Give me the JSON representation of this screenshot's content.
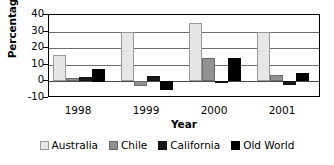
{
  "chart_data": {
    "type": "bar",
    "title": "",
    "xlabel": "Year",
    "ylabel": "Percentage",
    "categories": [
      "1998",
      "1999",
      "2000",
      "2001"
    ],
    "ylim": [
      -10,
      40
    ],
    "yticks": [
      40,
      30,
      20,
      10,
      0,
      -10
    ],
    "ytick_labels": [
      "40",
      "30",
      "20",
      "10",
      "0",
      "-10"
    ],
    "grid": true,
    "legend_position": "bottom",
    "series": [
      {
        "name": "Australia",
        "color": "#e6e6e6",
        "values": [
          16,
          30,
          35,
          30
        ]
      },
      {
        "name": "Chile",
        "color": "#919191",
        "values": [
          2,
          -3,
          14,
          4
        ]
      },
      {
        "name": "California",
        "color": "#1a1a1a",
        "values": [
          2.5,
          3.5,
          0.5,
          -2
        ]
      },
      {
        "name": "Old World",
        "color": "#000000",
        "values": [
          7.5,
          -5,
          14,
          5
        ]
      }
    ]
  },
  "legend": {
    "items": [
      {
        "label": "Australia"
      },
      {
        "label": "Chile"
      },
      {
        "label": "California"
      },
      {
        "label": "Old World"
      }
    ]
  }
}
